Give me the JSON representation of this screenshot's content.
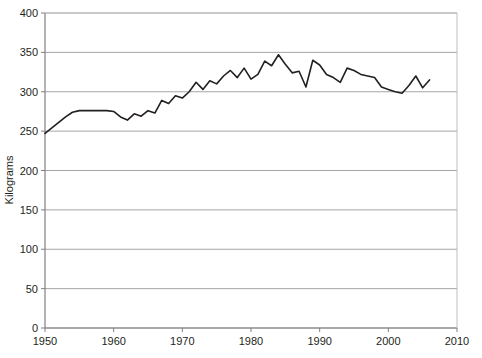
{
  "chart_data": {
    "type": "line",
    "title": "",
    "xlabel": "",
    "ylabel": "Kilograms",
    "xlim": [
      1950,
      2010
    ],
    "ylim": [
      0,
      400
    ],
    "grid": true,
    "legend": false,
    "xticks": [
      "1950",
      "1960",
      "1970",
      "1980",
      "1990",
      "2000",
      "2010"
    ],
    "xtick_values": [
      1950,
      1960,
      1970,
      1980,
      1990,
      2000,
      2010
    ],
    "yticks": [
      "0",
      "50",
      "100",
      "150",
      "200",
      "250",
      "300",
      "350",
      "400"
    ],
    "ytick_values": [
      0,
      50,
      100,
      150,
      200,
      250,
      300,
      350,
      400
    ],
    "line_color": "#231f20",
    "grid_color": "#a6a6a6",
    "series": [
      {
        "name": "Kilograms",
        "x": [
          1950,
          1951,
          1952,
          1953,
          1954,
          1955,
          1956,
          1957,
          1958,
          1959,
          1960,
          1961,
          1962,
          1963,
          1964,
          1965,
          1966,
          1967,
          1968,
          1969,
          1970,
          1971,
          1972,
          1973,
          1974,
          1975,
          1976,
          1977,
          1978,
          1979,
          1980,
          1981,
          1982,
          1983,
          1984,
          1985,
          1986,
          1987,
          1988,
          1989,
          1990,
          1991,
          1992,
          1993,
          1994,
          1995,
          1996,
          1997,
          1998,
          1999,
          2000,
          2001,
          2002,
          2003,
          2004,
          2005,
          2006
        ],
        "values": [
          247,
          254,
          261,
          268,
          274,
          276,
          276,
          276,
          276,
          276,
          275,
          268,
          264,
          272,
          269,
          276,
          273,
          289,
          285,
          295,
          292,
          300,
          312,
          303,
          314,
          310,
          320,
          327,
          318,
          330,
          316,
          322,
          339,
          333,
          347,
          335,
          324,
          326,
          306,
          340,
          334,
          322,
          318,
          312,
          330,
          327,
          322,
          320,
          318,
          306,
          303,
          300,
          298,
          308,
          320,
          305,
          315
        ]
      }
    ]
  }
}
